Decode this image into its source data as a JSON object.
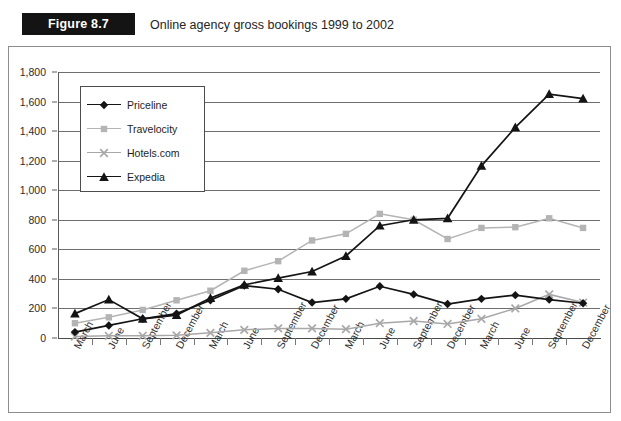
{
  "figure": {
    "badge_label": "Figure 8.7",
    "title": "Online agency gross bookings 1999 to 2002"
  },
  "chart_data": {
    "type": "line",
    "title": "Online agency gross bookings 1999 to 2002",
    "xlabel": "",
    "ylabel": "",
    "ylim": [
      0,
      1800
    ],
    "ytick_step": 200,
    "grid": true,
    "legend_position": "inside-top-left",
    "ytick_labels": [
      "0",
      "200",
      "400",
      "600",
      "800",
      "1,000",
      "1,200",
      "1,400",
      "1,600",
      "1,800"
    ],
    "categories": [
      "March",
      "June",
      "September",
      "December",
      "March",
      "June",
      "September",
      "December",
      "March",
      "June",
      "September",
      "December",
      "March",
      "June",
      "September",
      "December"
    ],
    "series": [
      {
        "name": "Priceline",
        "marker": "diamond",
        "color": "#141414",
        "values": [
          40,
          85,
          130,
          165,
          255,
          355,
          330,
          240,
          265,
          350,
          295,
          230,
          265,
          290,
          260,
          235
        ]
      },
      {
        "name": "Travelocity",
        "marker": "square",
        "color": "#b4b4b4",
        "values": [
          100,
          140,
          190,
          255,
          320,
          455,
          520,
          660,
          705,
          840,
          800,
          670,
          745,
          750,
          810,
          745
        ]
      },
      {
        "name": "Hotels.com",
        "marker": "cross",
        "color": "#a8a8a8",
        "values": [
          10,
          15,
          15,
          18,
          35,
          55,
          65,
          65,
          60,
          100,
          115,
          95,
          130,
          200,
          295,
          240
        ]
      },
      {
        "name": "Expedia",
        "marker": "triangle",
        "color": "#141414",
        "values": [
          165,
          260,
          130,
          155,
          270,
          360,
          405,
          450,
          555,
          760,
          800,
          810,
          1165,
          1425,
          1650,
          1620
        ]
      }
    ]
  }
}
